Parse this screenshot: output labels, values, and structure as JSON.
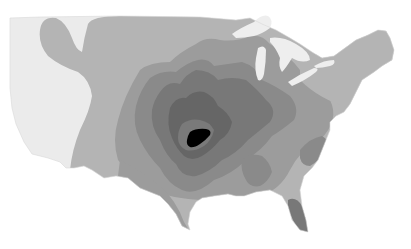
{
  "map": {
    "region": "Contiguous United States",
    "type": "grayscale contour / intensity map",
    "levels": [
      {
        "name": "level-1",
        "color": "#ebebeb"
      },
      {
        "name": "level-2",
        "color": "#b4b4b4"
      },
      {
        "name": "level-3",
        "color": "#9c9c9c"
      },
      {
        "name": "level-4",
        "color": "#8a8a8a"
      },
      {
        "name": "level-5",
        "color": "#787878"
      },
      {
        "name": "level-6",
        "color": "#666666"
      },
      {
        "name": "level-peak",
        "color": "#000000"
      }
    ],
    "water_color": "#eeeeee",
    "background_color": "#ffffff"
  }
}
